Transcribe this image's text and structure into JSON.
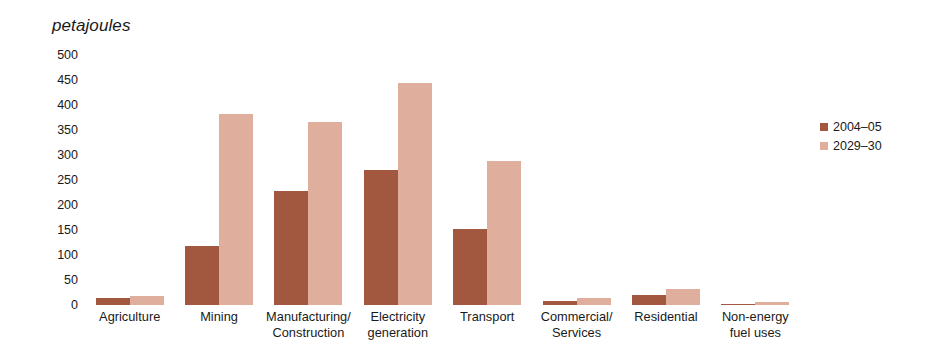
{
  "chart_data": {
    "type": "bar",
    "title": "",
    "subtitle": "",
    "xlabel": "",
    "ylabel": "petajoules",
    "ylim": [
      0,
      500
    ],
    "y_ticks": [
      500,
      450,
      400,
      350,
      300,
      250,
      200,
      150,
      100,
      50,
      0
    ],
    "grid": false,
    "legend_position": "right",
    "categories": [
      "Agriculture",
      "Manufacturing/\nConstruction",
      "Mining",
      "Electricity\ngeneration",
      "Transport",
      "Commercial/\nServices",
      "Residential",
      "Non-energy\nfuel uses"
    ],
    "categories_display": [
      "Agriculture",
      "Mining",
      "Manufacturing/\nConstruction",
      "Electricity\ngeneration",
      "Transport",
      "Commercial/\nServices",
      "Residential",
      "Non-energy\nfuel uses"
    ],
    "series": [
      {
        "name": "2004–05",
        "color": "#a2583f",
        "values": [
          15,
          118,
          228,
          270,
          153,
          8,
          20,
          3
        ]
      },
      {
        "name": "2029–30",
        "color": "#dfae9c",
        "values": [
          18,
          382,
          367,
          445,
          288,
          14,
          33,
          7
        ]
      }
    ]
  },
  "legend": {
    "items": [
      {
        "label": "2004–05",
        "color": "#a2583f"
      },
      {
        "label": "2029–30",
        "color": "#dfae9c"
      }
    ]
  }
}
